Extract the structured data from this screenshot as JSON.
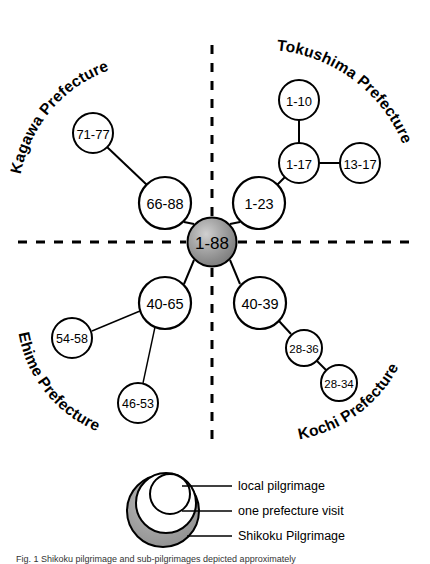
{
  "figure": {
    "center_node": {
      "label": "1-88",
      "name": "center-node-shikoku-pilgrimage",
      "cx": 212,
      "cy": 242,
      "r": 24.5,
      "fill": "#8f8f8f"
    },
    "dividers": [
      {
        "name": "divider-vertical-top",
        "x1": 212,
        "y1": 45,
        "x2": 212,
        "y2": 216
      },
      {
        "name": "divider-vertical-bottom",
        "x1": 212,
        "y1": 268,
        "x2": 212,
        "y2": 448
      },
      {
        "name": "divider-horizontal-left",
        "x1": 18,
        "y1": 242,
        "x2": 186,
        "y2": 242
      },
      {
        "name": "divider-horizontal-right",
        "x1": 238,
        "y1": 242,
        "x2": 412,
        "y2": 242
      }
    ],
    "regions": [
      {
        "name": "region-label-kagawa",
        "label": "Kagawa Prefecture",
        "path_id": "arc-kagawa",
        "d": "M 20,178 A 138,138 0 0 1 150,62",
        "offset": "2%"
      },
      {
        "name": "region-label-tokushima",
        "label": "Tokushima Prefecture",
        "path_id": "arc-tokushima",
        "d": "M 272,50 A 152,152 0 0 1 414,196",
        "offset": "2%"
      },
      {
        "name": "region-label-ehime",
        "label": "Ehime Prefecture",
        "path_id": "arc-ehime",
        "d": "M 18,330 A 130,130 0 0 0 130,440",
        "offset": "2%"
      },
      {
        "name": "region-label-kochi",
        "label": "Kochi Prefecture",
        "path_id": "arc-kochi",
        "d": "M 296,440 A 140,140 0 0 0 412,330",
        "offset": "2%"
      }
    ],
    "nodes": [
      {
        "name": "node-66-88",
        "label": "66-88",
        "cx": 165,
        "cy": 203,
        "r": 26,
        "font": 14.5,
        "region": "kagawa"
      },
      {
        "name": "node-71-77",
        "label": "71-77",
        "cx": 93,
        "cy": 133,
        "r": 20,
        "font": 13,
        "region": "kagawa"
      },
      {
        "name": "node-1-23",
        "label": "1-23",
        "cx": 259,
        "cy": 203,
        "r": 26,
        "font": 14.5,
        "region": "tokushima"
      },
      {
        "name": "node-1-17",
        "label": "1-17",
        "cx": 299,
        "cy": 163,
        "r": 20,
        "font": 13,
        "region": "tokushima"
      },
      {
        "name": "node-1-10",
        "label": "1-10",
        "cx": 299,
        "cy": 100,
        "r": 20,
        "font": 13,
        "region": "tokushima"
      },
      {
        "name": "node-13-17",
        "label": "13-17",
        "cx": 360,
        "cy": 163,
        "r": 20,
        "font": 13,
        "region": "tokushima"
      },
      {
        "name": "node-40-65",
        "label": "40-65",
        "cx": 165,
        "cy": 303,
        "r": 26,
        "font": 14.5,
        "region": "ehime"
      },
      {
        "name": "node-54-58",
        "label": "54-58",
        "cx": 72,
        "cy": 338,
        "r": 20,
        "font": 12.5,
        "region": "ehime"
      },
      {
        "name": "node-46-53",
        "label": "46-53",
        "cx": 138,
        "cy": 403,
        "r": 20,
        "font": 12.5,
        "region": "ehime"
      },
      {
        "name": "node-40-39",
        "label": "40-39",
        "cx": 260,
        "cy": 303,
        "r": 26,
        "font": 14.5,
        "region": "kochi"
      },
      {
        "name": "node-28-36",
        "label": "28-36",
        "cx": 304,
        "cy": 348,
        "r": 18,
        "font": 11.5,
        "region": "kochi"
      },
      {
        "name": "node-28-34",
        "label": "28-34",
        "cx": 339,
        "cy": 383,
        "r": 18,
        "font": 11.5,
        "region": "kochi"
      }
    ],
    "edges": [
      {
        "name": "edge-66-88-to-71-77",
        "x1": 147,
        "y1": 185,
        "x2": 107,
        "y2": 147,
        "width": 2
      },
      {
        "name": "edge-1-23-to-1-17",
        "x1": 277,
        "y1": 185,
        "x2": 285,
        "y2": 177,
        "width": 2
      },
      {
        "name": "edge-1-17-to-1-10",
        "x1": 299,
        "y1": 143,
        "x2": 299,
        "y2": 120,
        "width": 2
      },
      {
        "name": "edge-1-17-to-13-17",
        "x1": 319,
        "y1": 163,
        "x2": 340,
        "y2": 163,
        "width": 2
      },
      {
        "name": "edge-40-65-to-54-58",
        "x1": 140,
        "y1": 311,
        "x2": 92,
        "y2": 331,
        "width": 1.4
      },
      {
        "name": "edge-40-65-to-46-53",
        "x1": 155,
        "y1": 327,
        "x2": 143,
        "y2": 383,
        "width": 1.4
      },
      {
        "name": "edge-40-39-to-28-36",
        "x1": 279,
        "y1": 321,
        "x2": 291,
        "y2": 334,
        "width": 2
      },
      {
        "name": "edge-28-36-to-28-34",
        "x1": 317,
        "y1": 361,
        "x2": 326,
        "y2": 370,
        "width": 2
      }
    ],
    "center_edges": [
      {
        "name": "edge-center-to-66-88",
        "x1": 194,
        "y1": 224,
        "x2": 184,
        "y2": 222
      },
      {
        "name": "edge-center-to-1-23",
        "x1": 230,
        "y1": 224,
        "x2": 240,
        "y2": 222
      },
      {
        "name": "edge-center-to-40-65",
        "x1": 194,
        "y1": 260,
        "x2": 184,
        "y2": 284
      },
      {
        "name": "edge-center-to-40-39",
        "x1": 230,
        "y1": 260,
        "x2": 240,
        "y2": 284
      }
    ]
  },
  "legend": {
    "name": "legend",
    "outer": {
      "name": "legend-outer-circle",
      "cx": 163,
      "cy": 511,
      "r": 36,
      "fill": "#9a9a9a"
    },
    "middle": {
      "name": "legend-middle-circle",
      "cx": 166,
      "cy": 503,
      "r": 30,
      "fill": "#ffffff"
    },
    "inner": {
      "name": "legend-inner-circle",
      "cx": 170,
      "cy": 494,
      "r": 20,
      "fill": "#ffffff"
    },
    "items": [
      {
        "name": "legend-item-local-pilgrimage",
        "label": "local pilgrimage",
        "leader_x1": 182,
        "leader_y1": 486,
        "leader_x2": 232,
        "leader_y2": 486,
        "text_x": 238,
        "text_y": 486
      },
      {
        "name": "legend-item-one-prefecture-visit",
        "label": "one prefecture visit",
        "leader_x1": 182,
        "leader_y1": 511,
        "leader_x2": 232,
        "leader_y2": 511,
        "text_x": 238,
        "text_y": 511
      },
      {
        "name": "legend-item-shikoku-pilgrimage",
        "label": "Shikoku Pilgrimage",
        "leader_x1": 187,
        "leader_y1": 536,
        "leader_x2": 232,
        "leader_y2": 536,
        "text_x": 238,
        "text_y": 536
      }
    ]
  },
  "caption": {
    "name": "figure-caption",
    "text": "Fig. 1 Shikoku pilgrimage and sub-pilgrimages depicted approximately"
  }
}
